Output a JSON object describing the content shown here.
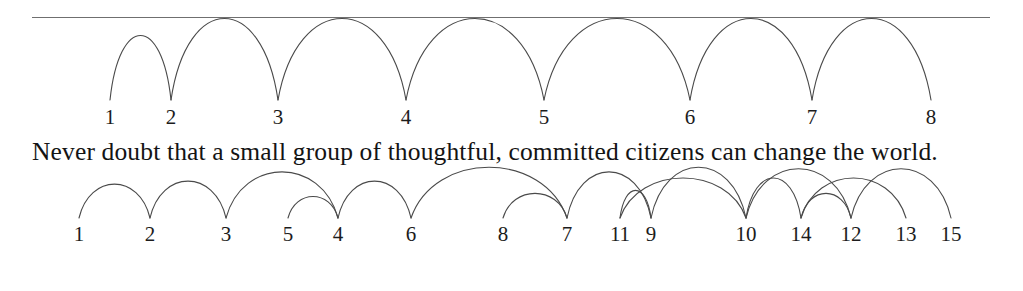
{
  "figure": {
    "background_color": "#ffffff",
    "arc_color": "#4a4a4a",
    "rule_color": "#6f6f6f",
    "text_color": "#141414"
  },
  "divider": {
    "label": "horizontal-rule",
    "x": 32,
    "y": 17,
    "width": 958
  },
  "sentence": {
    "text": "Never doubt that a small group of thoughtful, committed citizens can change the world."
  },
  "top_row": {
    "label": "top-index-sequence",
    "items": [
      {
        "label": "1",
        "x": 110
      },
      {
        "label": "2",
        "x": 171
      },
      {
        "label": "3",
        "x": 278
      },
      {
        "label": "4",
        "x": 406
      },
      {
        "label": "5",
        "x": 544
      },
      {
        "label": "6",
        "x": 690
      },
      {
        "label": "7",
        "x": 812
      },
      {
        "label": "8",
        "x": 931
      }
    ]
  },
  "bottom_row": {
    "label": "bottom-index-sequence",
    "items": [
      {
        "label": "1",
        "x": 79
      },
      {
        "label": "2",
        "x": 150
      },
      {
        "label": "3",
        "x": 226
      },
      {
        "label": "5",
        "x": 288
      },
      {
        "label": "4",
        "x": 338
      },
      {
        "label": "6",
        "x": 411
      },
      {
        "label": "8",
        "x": 503
      },
      {
        "label": "7",
        "x": 567
      },
      {
        "label": "11",
        "x": 620
      },
      {
        "label": "9",
        "x": 651
      },
      {
        "label": "10",
        "x": 746
      },
      {
        "label": "14",
        "x": 801
      },
      {
        "label": "12",
        "x": 851
      },
      {
        "label": "13",
        "x": 906
      },
      {
        "label": "15",
        "x": 951
      }
    ]
  },
  "chart_data": {
    "type": "arc-diagram",
    "title": "",
    "xlabel": "",
    "ylabel": "",
    "grid": false,
    "legend": null,
    "sentence": "Never doubt that a small group of thoughtful, committed citizens can change the world.",
    "panels": [
      {
        "name": "top-arc-diagram",
        "baseline_y": 100,
        "direction": "up",
        "node_order": [
          "1",
          "2",
          "3",
          "4",
          "5",
          "6",
          "7",
          "8"
        ],
        "node_x": [
          110,
          171,
          278,
          406,
          544,
          690,
          812,
          931
        ],
        "arcs": [
          {
            "from": "1",
            "to": "2",
            "from_x": 110,
            "to_x": 171,
            "height": 42
          },
          {
            "from": "2",
            "to": "3",
            "from_x": 171,
            "to_x": 278,
            "height": 53
          },
          {
            "from": "3",
            "to": "4",
            "from_x": 278,
            "to_x": 406,
            "height": 53
          },
          {
            "from": "4",
            "to": "5",
            "from_x": 406,
            "to_x": 544,
            "height": 53
          },
          {
            "from": "5",
            "to": "6",
            "from_x": 544,
            "to_x": 690,
            "height": 53
          },
          {
            "from": "6",
            "to": "7",
            "from_x": 690,
            "to_x": 812,
            "height": 53
          },
          {
            "from": "7",
            "to": "8",
            "from_x": 812,
            "to_x": 931,
            "height": 53
          }
        ]
      },
      {
        "name": "bottom-arc-diagram",
        "baseline_y": 218,
        "direction": "up",
        "node_order": [
          "1",
          "2",
          "3",
          "5",
          "4",
          "6",
          "8",
          "7",
          "11",
          "9",
          "10",
          "14",
          "12",
          "13",
          "15"
        ],
        "node_x": [
          79,
          150,
          226,
          288,
          338,
          411,
          503,
          567,
          620,
          651,
          746,
          801,
          851,
          906,
          951
        ],
        "arcs": [
          {
            "from_x": 79,
            "to_x": 150,
            "height": 22
          },
          {
            "from_x": 150,
            "to_x": 226,
            "height": 24
          },
          {
            "from_x": 226,
            "to_x": 338,
            "height": 30
          },
          {
            "from_x": 338,
            "to_x": 288,
            "height": 14
          },
          {
            "from_x": 338,
            "to_x": 411,
            "height": 24
          },
          {
            "from_x": 411,
            "to_x": 567,
            "height": 33
          },
          {
            "from_x": 567,
            "to_x": 503,
            "height": 16
          },
          {
            "from_x": 567,
            "to_x": 651,
            "height": 30
          },
          {
            "from_x": 651,
            "to_x": 620,
            "height": 18
          },
          {
            "from_x": 620,
            "to_x": 746,
            "height": 26
          },
          {
            "from_x": 651,
            "to_x": 746,
            "height": 33
          },
          {
            "from_x": 746,
            "to_x": 851,
            "height": 32
          },
          {
            "from_x": 746,
            "to_x": 801,
            "height": 26
          },
          {
            "from_x": 851,
            "to_x": 801,
            "height": 16
          },
          {
            "from_x": 801,
            "to_x": 906,
            "height": 26
          },
          {
            "from_x": 851,
            "to_x": 951,
            "height": 32
          }
        ]
      }
    ]
  }
}
